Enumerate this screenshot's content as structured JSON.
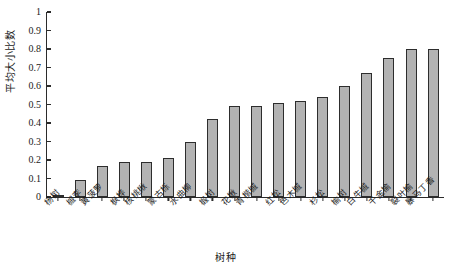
{
  "chart_data": {
    "type": "bar",
    "title": "",
    "xlabel": "树种",
    "ylabel": "平均大小比数",
    "ylim": [
      0,
      1
    ],
    "yticks": [
      "0",
      "0.1",
      "0.2",
      "0.3",
      "0.4",
      "0.5",
      "0.6",
      "0.7",
      "0.8",
      "0.9",
      "1"
    ],
    "grid": false,
    "legend": "none",
    "categories": [
      "杨树",
      "槭李",
      "黄菠萝",
      "枫桦",
      "核桃楸",
      "蒙古栎",
      "水曲柳",
      "椴树",
      "花楸",
      "青楷槭",
      "红松",
      "色木槭",
      "杉松",
      "榆树",
      "白牛槭",
      "千金榆",
      "裂叶榆",
      "暴马丁香"
    ],
    "values": [
      0.01,
      0.09,
      0.17,
      0.19,
      0.19,
      0.21,
      0.3,
      0.42,
      0.49,
      0.49,
      0.51,
      0.52,
      0.54,
      0.6,
      0.67,
      0.75,
      0.8,
      0.8
    ]
  }
}
